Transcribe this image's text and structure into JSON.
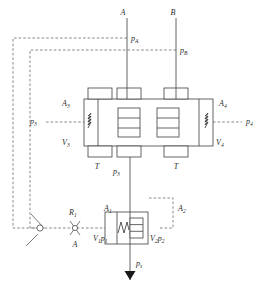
{
  "diagram": {
    "colors": {
      "line": "#555555",
      "dashed": "#6b6b6b",
      "text": "#2b2b2b",
      "fill": "#ffffff"
    },
    "ports": {
      "a_port": "A",
      "b_port": "B",
      "tank_left": "T",
      "tank_right": "T",
      "supply": "p",
      "supply_sub": "s"
    },
    "main_stage": {
      "pressure_a": {
        "base": "p",
        "sub": "A"
      },
      "pressure_b": {
        "base": "p",
        "sub": "B"
      },
      "area_left": {
        "base": "A",
        "sub": "3"
      },
      "area_right": {
        "base": "A",
        "sub": "4"
      },
      "volume_left": {
        "base": "V",
        "sub": "3"
      },
      "volume_right": {
        "base": "V",
        "sub": "4"
      },
      "pressure_left": {
        "base": "p",
        "sub": "3"
      },
      "pressure_right": {
        "base": "p",
        "sub": "4"
      },
      "pilot_pressure": {
        "base": "p",
        "sub": "3"
      }
    },
    "pilot_stage": {
      "restrictor": {
        "base": "R",
        "sub": "1"
      },
      "restrictor_port": "A",
      "area_left": {
        "base": "A",
        "sub": "1"
      },
      "area_right": {
        "base": "A",
        "sub": "2"
      },
      "chamber_left": {
        "base": "V",
        "sub": "1",
        "base2": "p",
        "sub2": "1"
      },
      "chamber_right": {
        "base": "V",
        "sub": "2",
        "base2": "p",
        "sub2": "2"
      }
    },
    "icons": {
      "spring_left": "spring-icon",
      "spring_right": "spring-icon",
      "spring_pilot": "spring-icon",
      "orifice": "orifice-icon",
      "supply_triangle": "pressure-source-icon",
      "pivot_node": "pivot-node-icon"
    }
  }
}
